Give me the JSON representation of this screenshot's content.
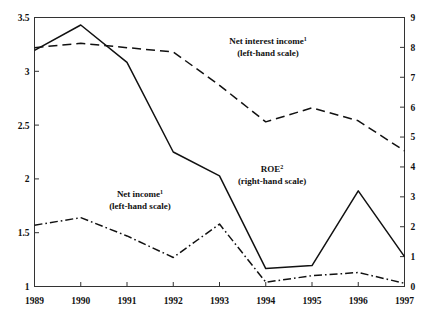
{
  "chart_data": {
    "type": "line",
    "title": "",
    "xlabel": "",
    "ylabel": "",
    "categories": [
      "1989",
      "1990",
      "1991",
      "1992",
      "1993",
      "1994",
      "1995",
      "1996",
      "1997"
    ],
    "x": [
      1989,
      1990,
      1991,
      1992,
      1993,
      1994,
      1995,
      1996,
      1997
    ],
    "left_axis": {
      "label": "",
      "ylim": [
        1,
        3.5
      ],
      "ticks": [
        1,
        1.5,
        2,
        2.5,
        3,
        3.5
      ],
      "tick_labels": [
        "1",
        "1.5",
        "2",
        "2.5",
        "3",
        "3.5"
      ],
      "position": "left"
    },
    "right_axis": {
      "label": "",
      "ylim": [
        0,
        9
      ],
      "ticks": [
        0,
        1,
        2,
        3,
        4,
        5,
        6,
        7,
        8,
        9
      ],
      "tick_labels": [
        "0",
        "1",
        "2",
        "3",
        "4",
        "5",
        "6",
        "7",
        "8",
        "9"
      ],
      "position": "right"
    },
    "grid": false,
    "legend": "annotations-inline",
    "series": [
      {
        "name": "Net interest income",
        "name_sup": "1",
        "scale": "left",
        "scale_note": "(left-hand scale)",
        "style": "dashed",
        "color": "#111111",
        "values": [
          3.22,
          3.26,
          3.22,
          3.18,
          2.87,
          2.53,
          2.66,
          2.54,
          2.26
        ]
      },
      {
        "name": "ROE",
        "name_sup": "2",
        "scale": "right",
        "scale_note": "(right-hand scale)",
        "style": "solid",
        "color": "#111111",
        "values": [
          7.9,
          8.75,
          7.5,
          4.5,
          3.7,
          0.6,
          0.7,
          3.2,
          1.0
        ]
      },
      {
        "name": "Net income",
        "name_sup": "1",
        "scale": "left",
        "scale_note": "(left-hand scale)",
        "style": "dashdot",
        "color": "#111111",
        "values": [
          1.57,
          1.64,
          1.47,
          1.27,
          1.58,
          1.04,
          1.1,
          1.13,
          1.03
        ]
      }
    ],
    "annotations": [
      {
        "id": "net-interest-income",
        "line1": "Net interest income",
        "sup": "1",
        "line2": "(left-hand scale)",
        "x": 268,
        "y": 44
      },
      {
        "id": "roe",
        "line1": "ROE",
        "sup": "2",
        "line2": "(right-hand scale)",
        "x": 272,
        "y": 172
      },
      {
        "id": "net-income",
        "line1": "Net income",
        "sup": "1",
        "line2": "(left-hand scale)",
        "x": 140,
        "y": 197
      }
    ]
  }
}
